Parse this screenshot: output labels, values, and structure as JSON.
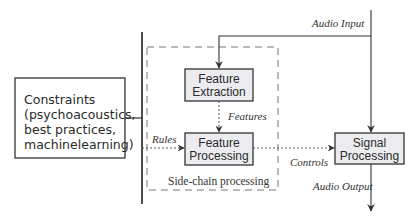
{
  "diagram": {
    "constraints": {
      "lines": [
        "Constraints",
        "(psychoacoustics,",
        "best practices,",
        "machinelearning)"
      ]
    },
    "side_chain": {
      "caption": "Side-chain processing",
      "feature_extraction": {
        "lines": [
          "Feature",
          "Extraction"
        ]
      },
      "feature_processing": {
        "lines": [
          "Feature",
          "Processing"
        ]
      }
    },
    "signal_processing": {
      "lines": [
        "Signal",
        "Processing"
      ]
    },
    "edges": {
      "audio_input": "Audio Input",
      "features": "Features",
      "rules": "Rules",
      "controls": "Controls",
      "audio_output": "Audio Output"
    },
    "colors": {
      "box_fill": "#ececf0",
      "constraints_fill": "#ffffff",
      "stroke": "#333333",
      "dashed": "#777777"
    }
  }
}
